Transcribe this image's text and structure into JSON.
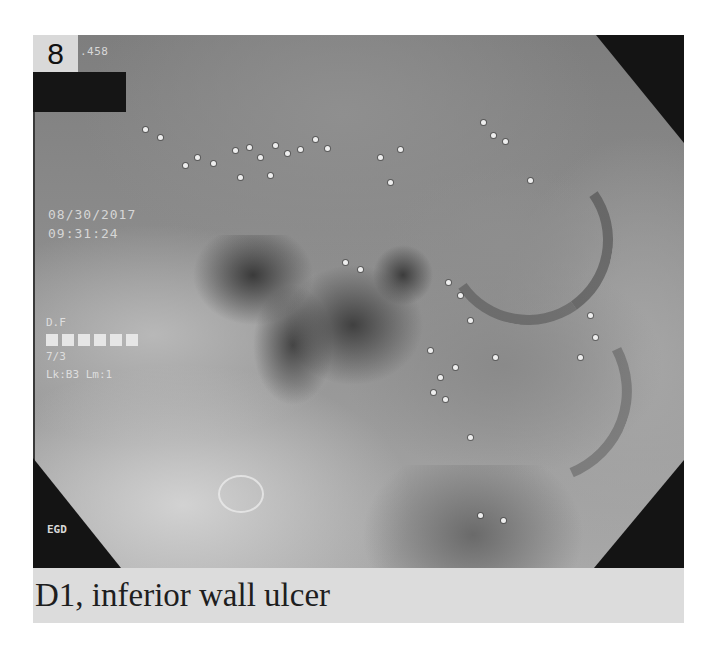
{
  "figure": {
    "image_number": "8",
    "id_fragment": ".458",
    "date": "08/30/2017",
    "time": "09:31:24",
    "side_info": {
      "line1": "D.F",
      "block_count": 6,
      "line3": "7/3",
      "line4": "Lk:B3 Lm:1"
    },
    "procedure_label": "EGD",
    "caption": "D1, inferior wall ulcer"
  },
  "colors": {
    "background": "#ffffff",
    "caption_strip": "#dcdcdc",
    "mask": "#141414",
    "overlay_text": "#d8d8d8"
  }
}
